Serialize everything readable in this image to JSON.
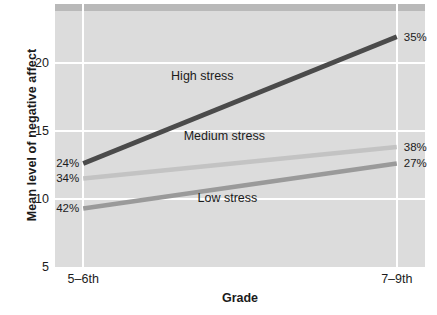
{
  "chart_data": {
    "type": "line",
    "title": "",
    "xlabel": "Grade",
    "ylabel": "Mean level of negative affect",
    "categories": [
      "5–6th",
      "7–9th"
    ],
    "x": [
      0,
      1
    ],
    "xtick_labels": [
      "5–6th",
      "7–9th"
    ],
    "ytick_labels": [
      "5",
      "10",
      "15",
      "20"
    ],
    "yticks": [
      5,
      10,
      15,
      20
    ],
    "ylim": [
      5,
      24.3
    ],
    "xlim": [
      -0.09,
      1.09
    ],
    "grid": true,
    "legend_position": "inline-annotations",
    "plot_background": "#dcdcdc",
    "series": [
      {
        "name": "High stress",
        "label": "High stress",
        "color": "#4b4b4b",
        "values": [
          12.6,
          21.9
        ],
        "point_labels": [
          "24%",
          "35%"
        ]
      },
      {
        "name": "Medium stress",
        "label": "Medium stress",
        "color": "#c3c3c3",
        "values": [
          11.5,
          13.8
        ],
        "point_labels": [
          "34%",
          "38%"
        ]
      },
      {
        "name": "Low stress",
        "label": "Low stress",
        "color": "#9a9a9a",
        "values": [
          9.3,
          12.6
        ],
        "point_labels": [
          "42%",
          "27%"
        ]
      }
    ],
    "annotations": [
      {
        "text": "High stress",
        "x": 0.38,
        "y": 19.0
      },
      {
        "text": "Medium stress",
        "x": 0.45,
        "y": 14.6
      },
      {
        "text": "Low stress",
        "x": 0.46,
        "y": 10.1
      }
    ]
  },
  "labels": {
    "y_axis_title": "Mean level of negative affect",
    "x_axis_title": "Grade",
    "ytick_20": "20",
    "ytick_15": "15",
    "ytick_10": "10",
    "ytick_5": "5",
    "xtick_left": "5–6th",
    "xtick_right": "7–9th",
    "high_left_pct": "24%",
    "high_right_pct": "35%",
    "medium_left_pct": "34%",
    "medium_right_pct": "38%",
    "low_left_pct": "42%",
    "low_right_pct": "27%",
    "high_series": "High stress",
    "medium_series": "Medium stress",
    "low_series": "Low stress"
  }
}
